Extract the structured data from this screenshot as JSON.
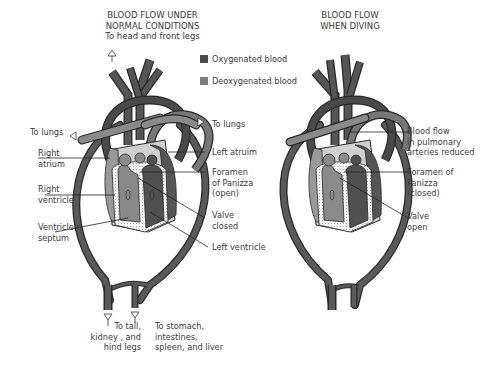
{
  "left_panel": {
    "title_line1": "BLOOD FLOW UNDER",
    "title_line2": "NORMAL CONDITIONS",
    "top_label": "To head and front legs",
    "to_lungs_left": "To lungs",
    "to_lungs_right": "To lungs",
    "right_atrium": [
      "Right",
      "atrium"
    ],
    "right_ventricle": [
      "Right",
      "ventricle"
    ],
    "ventricle_septum": [
      "Ventricle",
      "septum"
    ],
    "left_atrium": "Left atruim",
    "foramen": [
      "Foramen",
      "of Panizza",
      "(open)"
    ],
    "valve": [
      "Valve",
      "closed"
    ],
    "left_ventricle": "Left ventricle",
    "bottom_left": [
      "To tail,",
      "kidney ,  and",
      "hind legs"
    ],
    "bottom_right": [
      "To stomach,",
      "intestines,",
      "spleen, and  liver"
    ]
  },
  "right_panel": {
    "title_line1": "BLOOD FLOW",
    "title_line2": "WHEN DIVING",
    "pulmonary": [
      "Blood flow",
      "in pulmonary",
      "arteries reduced"
    ],
    "foramen": [
      "Foramen of",
      "Panizza",
      "(closed)"
    ],
    "valve": [
      "Valve",
      "open"
    ]
  },
  "legend": {
    "oxygenated": {
      "label": "Oxygenated blood",
      "color": "#4a4a4a"
    },
    "deoxygenated": {
      "label": "Deoxygenated blood",
      "color": "#7d7d7d"
    }
  },
  "colors": {
    "oxygenated": "#4a4a4a",
    "deoxygenated": "#858585",
    "outline": "#2a2a2a",
    "wall": "#e8e8e8"
  }
}
